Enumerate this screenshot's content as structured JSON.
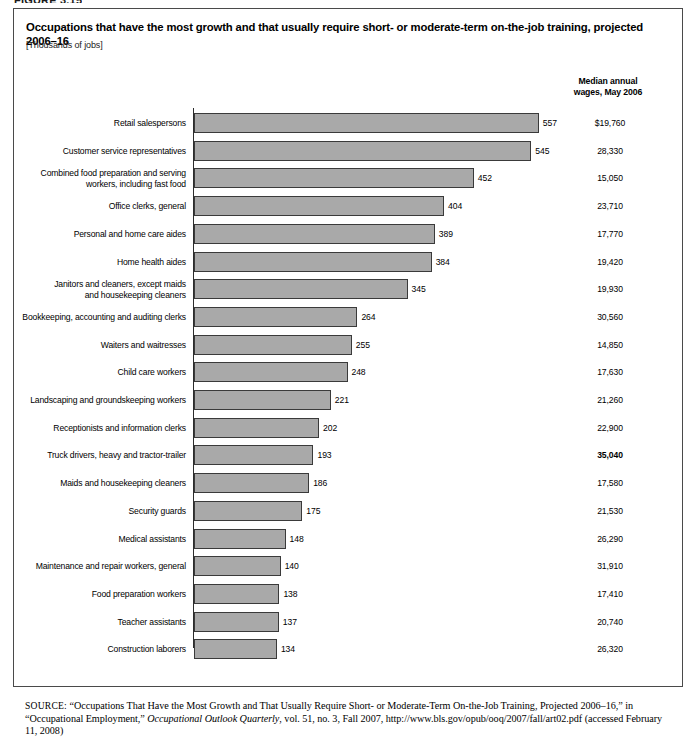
{
  "figure_label": "FIGURE 3.15",
  "header": {
    "title": "Occupations that have the most growth and that usually require short- or moderate-term on-the-job training, projected 2006–16",
    "units": "[Thousands of jobs]",
    "wages_column_header_line1": "Median annual",
    "wages_column_header_line2": "wages, May 2006"
  },
  "source": {
    "label": "SOURCE:",
    "part1": " “Occupations That Have the Most Growth and That Usually Require Short- or Moderate-Term On-the-Job Training, Projected 2006–16,” in “Occupational Employment,” ",
    "journal": "Occupational Outlook Quarterly",
    "part2": ", vol. 51, no. 3, Fall 2007, http://www.bls.gov/opub/ooq/2007/fall/art02.pdf (accessed February 11, 2008)"
  },
  "chart_data": {
    "type": "bar",
    "orientation": "horizontal",
    "title": "Occupations that have the most growth and that usually require short- or moderate-term on-the-job training, projected 2006–16",
    "xlabel": "",
    "ylabel": "",
    "units": "[Thousands of jobs]",
    "xlim": [
      0,
      600
    ],
    "grid": false,
    "legend": false,
    "bar_color": "#a9a9a9",
    "bar_border_color": "#3a3a3a",
    "value_column_header": "Median annual wages, May 2006",
    "categories": [
      "Retail salespersons",
      "Customer service representatives",
      "Combined food preparation and serving workers, including fast food",
      "Office clerks, general",
      "Personal and home care aides",
      "Home health aides",
      "Janitors and cleaners, except maids and housekeeping cleaners",
      "Bookkeeping, accounting and auditing clerks",
      "Waiters and waitresses",
      "Child care workers",
      "Landscaping and groundskeeping workers",
      "Receptionists and information clerks",
      "Truck drivers, heavy and tractor-trailer",
      "Maids and housekeeping cleaners",
      "Security guards",
      "Medical assistants",
      "Maintenance and repair workers, general",
      "Food preparation workers",
      "Teacher assistants",
      "Construction laborers"
    ],
    "values": [
      557,
      545,
      452,
      404,
      389,
      384,
      345,
      264,
      255,
      248,
      221,
      202,
      193,
      186,
      175,
      148,
      140,
      138,
      137,
      134
    ],
    "median_wages": [
      "$19,760",
      "28,330",
      "15,050",
      "23,710",
      "17,770",
      "19,420",
      "19,930",
      "30,560",
      "14,850",
      "17,630",
      "21,260",
      "22,900",
      "35,040",
      "17,580",
      "21,530",
      "26,290",
      "31,910",
      "17,410",
      "20,740",
      "26,320"
    ]
  },
  "rows": [
    {
      "label_lines": [
        "Retail salespersons"
      ],
      "value": 557,
      "wage": "$19,760",
      "wage_bold": false
    },
    {
      "label_lines": [
        "Customer service representatives"
      ],
      "value": 545,
      "wage": "28,330",
      "wage_bold": false
    },
    {
      "label_lines": [
        "Combined food preparation and serving",
        "workers, including fast food"
      ],
      "value": 452,
      "wage": "15,050",
      "wage_bold": false
    },
    {
      "label_lines": [
        "Office clerks, general"
      ],
      "value": 404,
      "wage": "23,710",
      "wage_bold": false
    },
    {
      "label_lines": [
        "Personal and home care aides"
      ],
      "value": 389,
      "wage": "17,770",
      "wage_bold": false
    },
    {
      "label_lines": [
        "Home health aides"
      ],
      "value": 384,
      "wage": "19,420",
      "wage_bold": false
    },
    {
      "label_lines": [
        "Janitors and cleaners, except maids",
        "and housekeeping cleaners"
      ],
      "value": 345,
      "wage": "19,930",
      "wage_bold": false
    },
    {
      "label_lines": [
        "Bookkeeping, accounting and auditing clerks"
      ],
      "value": 264,
      "wage": "30,560",
      "wage_bold": false
    },
    {
      "label_lines": [
        "Waiters and waitresses"
      ],
      "value": 255,
      "wage": "14,850",
      "wage_bold": false
    },
    {
      "label_lines": [
        "Child care workers"
      ],
      "value": 248,
      "wage": "17,630",
      "wage_bold": false
    },
    {
      "label_lines": [
        "Landscaping and groundskeeping workers"
      ],
      "value": 221,
      "wage": "21,260",
      "wage_bold": false
    },
    {
      "label_lines": [
        "Receptionists and information clerks"
      ],
      "value": 202,
      "wage": "22,900",
      "wage_bold": false
    },
    {
      "label_lines": [
        "Truck drivers, heavy and tractor-trailer"
      ],
      "value": 193,
      "wage": "35,040",
      "wage_bold": true
    },
    {
      "label_lines": [
        "Maids and housekeeping cleaners"
      ],
      "value": 186,
      "wage": "17,580",
      "wage_bold": false
    },
    {
      "label_lines": [
        "Security guards"
      ],
      "value": 175,
      "wage": "21,530",
      "wage_bold": false
    },
    {
      "label_lines": [
        "Medical assistants"
      ],
      "value": 148,
      "wage": "26,290",
      "wage_bold": false
    },
    {
      "label_lines": [
        "Maintenance and repair workers, general"
      ],
      "value": 140,
      "wage": "31,910",
      "wage_bold": false
    },
    {
      "label_lines": [
        "Food preparation workers"
      ],
      "value": 138,
      "wage": "17,410",
      "wage_bold": false
    },
    {
      "label_lines": [
        "Teacher assistants"
      ],
      "value": 137,
      "wage": "20,740",
      "wage_bold": false
    },
    {
      "label_lines": [
        "Construction laborers"
      ],
      "value": 134,
      "wage": "26,320",
      "wage_bold": false
    }
  ]
}
